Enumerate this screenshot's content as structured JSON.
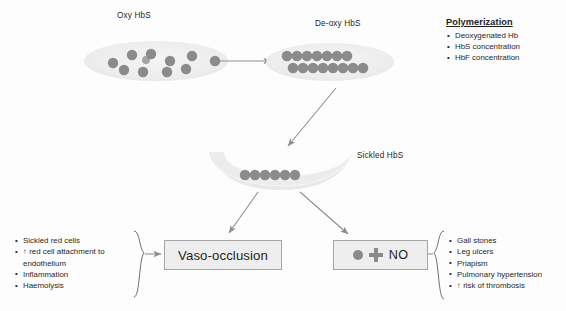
{
  "diagram": {
    "colors": {
      "cell_fill": "#ececec",
      "hb_dot": "#8b8b8b",
      "box_fill": "#eeeeee",
      "box_border": "#a6a6a6",
      "arrow": "#8d8d8d",
      "text": "#231f20"
    }
  },
  "cells": {
    "oxy": {
      "label": "Oxy HbS",
      "dot_count": 11,
      "dots": [
        [
          29,
          20
        ],
        [
          48,
          13
        ],
        [
          66,
          12
        ],
        [
          85,
          19
        ],
        [
          104,
          13
        ],
        [
          128,
          18
        ],
        [
          158,
          22
        ],
        [
          57,
          28
        ],
        [
          77,
          30
        ],
        [
          100,
          30
        ],
        [
          118,
          26
        ]
      ]
    },
    "deoxy": {
      "label": "De-oxy HbS",
      "dot_count": 15,
      "rows": [
        7,
        8
      ]
    },
    "sickled": {
      "label": "Sickled HbS",
      "dot_count": 6
    }
  },
  "polymerization": {
    "title": "Polymerization",
    "factors": [
      "Deoxygenated Hb",
      "HbS concentration",
      "HbF concentration"
    ]
  },
  "vaso_occlusion": {
    "label": "Vaso-occlusion",
    "causes": [
      "Sickled red cells",
      "↑ red cell attachment to endothelium",
      "Inflammation",
      "Haemolysis"
    ]
  },
  "nitric_oxide": {
    "dot_icon": "hb-dot-icon",
    "plus_icon": "plus-icon",
    "label": "NO",
    "consequences": [
      "Gall stones",
      "Leg ulcers",
      "Priapism",
      "Pulmonary hypertension",
      "↑ risk of thrombosis"
    ]
  }
}
